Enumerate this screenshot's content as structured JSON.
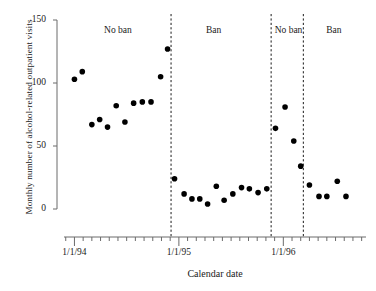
{
  "chart_data": {
    "type": "scatter",
    "title": "",
    "xlabel": "Calendar date",
    "ylabel": "Monthly number of alcohol-related outpatient visits",
    "ylim": [
      0,
      150
    ],
    "yticks": [
      0,
      50,
      100,
      150
    ],
    "ytick_labels": [
      "0",
      "50",
      "100",
      "150"
    ],
    "xtick_labels": [
      "1/1/94",
      "1/1/95",
      "1/1/96"
    ],
    "xtick_months": [
      0,
      12,
      24
    ],
    "xlim_months": [
      -1.2,
      33.5
    ],
    "grid": false,
    "legend": null,
    "annotations": [
      {
        "label": "No ban",
        "month": 5.0
      },
      {
        "label": "Ban",
        "month": 16.0
      },
      {
        "label": "No ban",
        "month": 24.6
      },
      {
        "label": "Ban",
        "month": 29.8
      }
    ],
    "dividers": [
      {
        "month": 11.1
      },
      {
        "month": 22.6
      },
      {
        "month": 26.3
      }
    ],
    "series": [
      {
        "name": "Monthly alcohol-related outpatient visits",
        "marker": "filled-circle",
        "color": "#000000",
        "points": [
          {
            "x": 0.0,
            "y": 103
          },
          {
            "x": 0.9,
            "y": 109
          },
          {
            "x": 2.0,
            "y": 67
          },
          {
            "x": 2.9,
            "y": 71
          },
          {
            "x": 3.8,
            "y": 65
          },
          {
            "x": 4.8,
            "y": 82
          },
          {
            "x": 5.8,
            "y": 69
          },
          {
            "x": 6.8,
            "y": 84
          },
          {
            "x": 7.8,
            "y": 85
          },
          {
            "x": 8.8,
            "y": 85
          },
          {
            "x": 9.9,
            "y": 105
          },
          {
            "x": 10.7,
            "y": 127
          },
          {
            "x": 11.5,
            "y": 24
          },
          {
            "x": 12.6,
            "y": 12
          },
          {
            "x": 13.5,
            "y": 8
          },
          {
            "x": 14.4,
            "y": 8
          },
          {
            "x": 15.3,
            "y": 4
          },
          {
            "x": 16.3,
            "y": 18
          },
          {
            "x": 17.2,
            "y": 7
          },
          {
            "x": 18.2,
            "y": 12
          },
          {
            "x": 19.2,
            "y": 17
          },
          {
            "x": 20.1,
            "y": 16
          },
          {
            "x": 21.1,
            "y": 13
          },
          {
            "x": 22.1,
            "y": 16
          },
          {
            "x": 23.1,
            "y": 64
          },
          {
            "x": 24.2,
            "y": 81
          },
          {
            "x": 25.2,
            "y": 54
          },
          {
            "x": 26.0,
            "y": 34
          },
          {
            "x": 27.0,
            "y": 19
          },
          {
            "x": 28.1,
            "y": 10
          },
          {
            "x": 29.0,
            "y": 10
          },
          {
            "x": 30.2,
            "y": 22
          },
          {
            "x": 31.2,
            "y": 10
          }
        ]
      }
    ]
  }
}
